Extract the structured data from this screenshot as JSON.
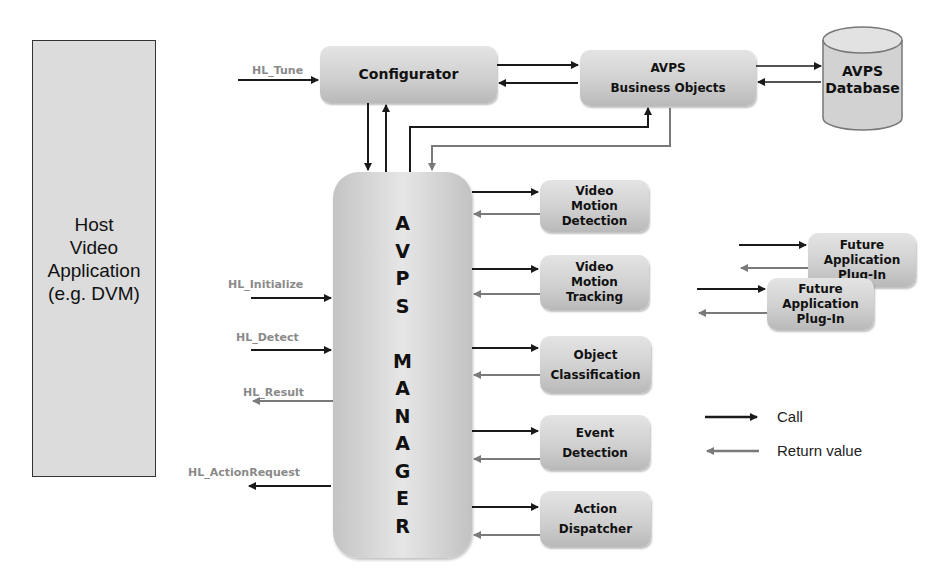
{
  "host": {
    "label": "Host\nVideo\nApplication\n(e.g. DVM)"
  },
  "configurator": {
    "label": "Configurator"
  },
  "business_objects": {
    "label": "AVPS\nBusiness Objects"
  },
  "database": {
    "label": "AVPS\nDatabase"
  },
  "manager": {
    "label": "A\nV\nP\nS\n\nM\nA\nN\nA\nG\nE\nR"
  },
  "plugins": [
    {
      "label": "Video\nMotion\nDetection"
    },
    {
      "label": "Video\nMotion\nTracking"
    },
    {
      "label": "Object\nClassification"
    },
    {
      "label": "Event\nDetection"
    },
    {
      "label": "Action\nDispatcher"
    }
  ],
  "future_plugins": [
    {
      "label": "Future\nApplication\nPlug-In"
    },
    {
      "label": "Future\nApplication\nPlug-In"
    }
  ],
  "api_calls": {
    "tune": "HL_Tune",
    "initialize": "HL_Initialize",
    "detect": "HL_Detect",
    "result": "HL_Result",
    "action_request": "HL_ActionRequest"
  },
  "legend": {
    "call": "Call",
    "return_value": "Return value"
  },
  "colors": {
    "call_arrow": "#1a1a1a",
    "return_arrow": "#7a7a7a",
    "box_fill": "#d4d4d4",
    "label_gray": "#8a8a8a"
  }
}
